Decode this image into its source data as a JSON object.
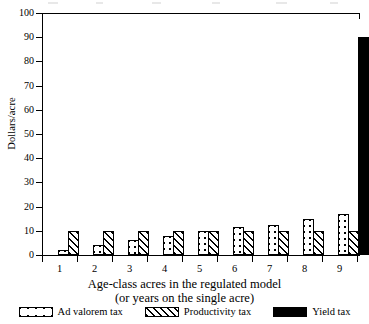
{
  "chart_data": {
    "type": "bar",
    "title": "",
    "xlabel": "Age-class acres in the regulated model (or years on the single acre)",
    "ylabel": "Dollars/acre",
    "categories": [
      "1",
      "2",
      "3",
      "4",
      "5",
      "6",
      "7",
      "8",
      "9"
    ],
    "ylim": [
      0,
      100
    ],
    "yticks": [
      0,
      10,
      20,
      30,
      40,
      50,
      60,
      70,
      80,
      90,
      100
    ],
    "grid": false,
    "legend_position": "bottom",
    "series": [
      {
        "name": "Ad valorem tax",
        "pattern": "cross-hatch-diamond",
        "values": [
          2,
          4,
          6,
          8,
          9.8,
          11.5,
          12.6,
          15,
          17
        ]
      },
      {
        "name": "Productivity tax",
        "pattern": "diagonal-hatch",
        "values": [
          10,
          10,
          9.8,
          9.8,
          9.8,
          9.8,
          9.8,
          9.8,
          9.8
        ]
      },
      {
        "name": "Yield tax",
        "pattern": "solid-black",
        "values": [
          0,
          0,
          0,
          0,
          0,
          0,
          0,
          0,
          90
        ]
      }
    ]
  },
  "axes": {
    "y": {
      "title": "Dollars/acre",
      "tick_labels": [
        "0",
        "10",
        "20",
        "30",
        "40",
        "50",
        "60",
        "70",
        "80",
        "90",
        "100"
      ]
    },
    "x": {
      "tick_labels": [
        "1",
        "2",
        "3",
        "4",
        "5",
        "6",
        "7",
        "8",
        "9"
      ],
      "title_line1": "Age-class acres in the regulated model",
      "title_line2": "(or years on the single acre)"
    }
  },
  "legend": {
    "items": [
      {
        "label": "Ad valorem tax",
        "swatch": "cross-hatch-diamond-swatch"
      },
      {
        "label": "Productivity tax",
        "swatch": "diagonal-hatch-swatch"
      },
      {
        "label": "Yield tax",
        "swatch": "solid-black-swatch"
      }
    ]
  },
  "colors": {
    "ink": "#000000",
    "background": "#ffffff"
  }
}
